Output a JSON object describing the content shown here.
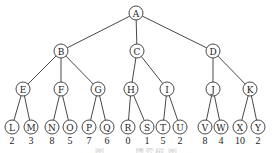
{
  "diagram": {
    "type": "tree",
    "node_radius": 7,
    "colors": {
      "stroke": "#333333",
      "fill": "#ffffff",
      "text": "#222222"
    },
    "nodes": [
      {
        "id": "A",
        "label": "A",
        "x": 136,
        "y": 13
      },
      {
        "id": "B",
        "label": "B",
        "x": 61,
        "y": 51
      },
      {
        "id": "C",
        "label": "C",
        "x": 137,
        "y": 51
      },
      {
        "id": "D",
        "label": "D",
        "x": 213,
        "y": 51
      },
      {
        "id": "E",
        "label": "E",
        "x": 23,
        "y": 89
      },
      {
        "id": "F",
        "label": "F",
        "x": 61,
        "y": 89
      },
      {
        "id": "G",
        "label": "G",
        "x": 98,
        "y": 89
      },
      {
        "id": "H",
        "label": "H",
        "x": 131,
        "y": 89
      },
      {
        "id": "I",
        "label": "I",
        "x": 167,
        "y": 89
      },
      {
        "id": "J",
        "label": "J",
        "x": 213,
        "y": 89
      },
      {
        "id": "K",
        "label": "K",
        "x": 250,
        "y": 89
      },
      {
        "id": "L",
        "label": "L",
        "x": 12,
        "y": 127,
        "value": "2"
      },
      {
        "id": "M",
        "label": "M",
        "x": 31,
        "y": 127,
        "value": "3"
      },
      {
        "id": "N",
        "label": "N",
        "x": 52,
        "y": 127,
        "value": "8"
      },
      {
        "id": "O",
        "label": "O",
        "x": 70,
        "y": 127,
        "value": "5"
      },
      {
        "id": "P",
        "label": "P",
        "x": 89,
        "y": 127,
        "value": "7"
      },
      {
        "id": "Q",
        "label": "Q",
        "x": 107,
        "y": 127,
        "value": "6"
      },
      {
        "id": "R",
        "label": "R",
        "x": 128,
        "y": 127,
        "value": "0"
      },
      {
        "id": "S",
        "label": "S",
        "x": 147,
        "y": 127,
        "value": "1"
      },
      {
        "id": "T",
        "label": "T",
        "x": 163,
        "y": 127,
        "value": "5"
      },
      {
        "id": "U",
        "label": "U",
        "x": 180,
        "y": 127,
        "value": "2"
      },
      {
        "id": "V",
        "label": "V",
        "x": 205,
        "y": 127,
        "value": "8"
      },
      {
        "id": "W",
        "label": "W",
        "x": 221,
        "y": 127,
        "value": "4"
      },
      {
        "id": "X",
        "label": "X",
        "x": 240,
        "y": 127,
        "value": "10"
      },
      {
        "id": "Y",
        "label": "Y",
        "x": 258,
        "y": 127,
        "value": "2"
      }
    ],
    "edges": [
      [
        "A",
        "B"
      ],
      [
        "A",
        "C"
      ],
      [
        "A",
        "D"
      ],
      [
        "B",
        "E"
      ],
      [
        "B",
        "F"
      ],
      [
        "B",
        "G"
      ],
      [
        "C",
        "H"
      ],
      [
        "C",
        "I"
      ],
      [
        "D",
        "J"
      ],
      [
        "D",
        "K"
      ],
      [
        "E",
        "L"
      ],
      [
        "E",
        "M"
      ],
      [
        "F",
        "N"
      ],
      [
        "F",
        "O"
      ],
      [
        "G",
        "P"
      ],
      [
        "G",
        "Q"
      ],
      [
        "H",
        "R"
      ],
      [
        "H",
        "S"
      ],
      [
        "I",
        "T"
      ],
      [
        "I",
        "U"
      ],
      [
        "J",
        "V"
      ],
      [
        "J",
        "W"
      ],
      [
        "K",
        "X"
      ],
      [
        "K",
        "Y"
      ]
    ],
    "caption": "图 — — 博弈树 图"
  }
}
